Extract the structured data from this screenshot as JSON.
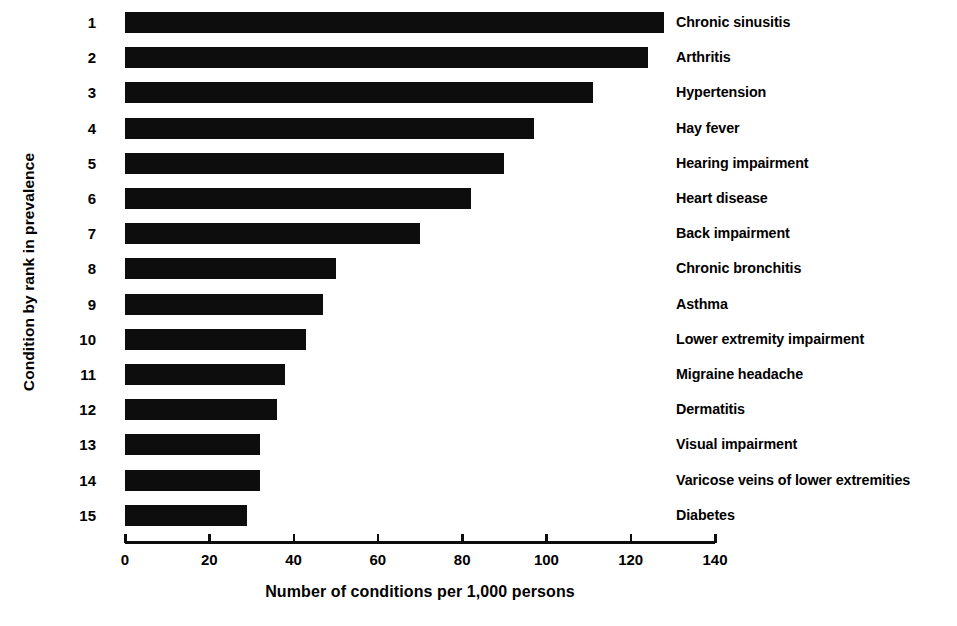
{
  "chart_data": {
    "type": "bar",
    "orientation": "horizontal",
    "title": "",
    "xlabel": "Number of conditions per 1,000 persons",
    "ylabel": "Condition by rank in prevalence",
    "xlim": [
      0,
      140
    ],
    "xticks": [
      0,
      20,
      40,
      60,
      80,
      100,
      120,
      140
    ],
    "grid": false,
    "legend": null,
    "bar_color": "#0d0d0d",
    "background_color": "#ffffff",
    "ranks": [
      "1",
      "2",
      "3",
      "4",
      "5",
      "6",
      "7",
      "8",
      "9",
      "10",
      "11",
      "12",
      "13",
      "14",
      "15"
    ],
    "categories": [
      "Chronic sinusitis",
      "Arthritis",
      "Hypertension",
      "Hay fever",
      "Hearing impairment",
      "Heart disease",
      "Back impairment",
      "Chronic bronchitis",
      "Asthma",
      "Lower extremity impairment",
      "Migraine headache",
      "Dermatitis",
      "Visual impairment",
      "Varicose veins of lower extremities",
      "Diabetes"
    ],
    "values": [
      128,
      124,
      111,
      97,
      90,
      82,
      70,
      50,
      47,
      43,
      38,
      36,
      32,
      32,
      29
    ]
  }
}
